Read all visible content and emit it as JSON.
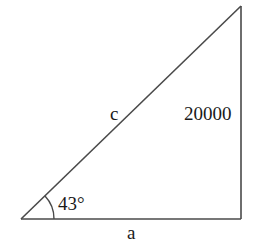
{
  "diagram": {
    "type": "right-triangle",
    "stroke_color": "#4a4a4a",
    "text_color": "#1a1a1a",
    "background": "#ffffff",
    "vertices": {
      "bottom_left": [
        21,
        219
      ],
      "bottom_right": [
        241,
        219
      ],
      "top_right": [
        241,
        6
      ]
    },
    "labels": {
      "hypotenuse": "c",
      "opposite_side": "20000",
      "adjacent_side": "a",
      "angle": "43°"
    },
    "right_angle_at": "bottom_right"
  }
}
